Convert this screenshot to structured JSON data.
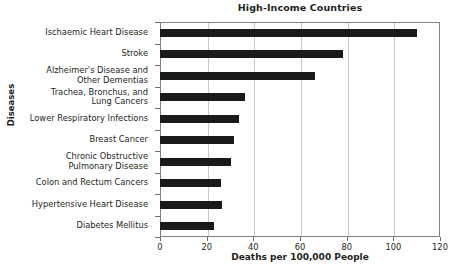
{
  "chart_data": {
    "type": "bar",
    "orientation": "horizontal",
    "title": "High-Income Countries",
    "xlabel": "Deaths per 100,000 People",
    "ylabel": "Diseases",
    "xlim": [
      0,
      120
    ],
    "xticks": [
      0,
      20,
      40,
      60,
      80,
      100,
      120
    ],
    "grid": "vertical",
    "legend": "none",
    "bar_color": "#1a1a1a",
    "categories": [
      "Ischaemic Heart Disease",
      "Stroke",
      "Alzheimer's Disease and\nOther Dementias",
      "Trachea, Bronchus, and\nLung Cancers",
      "Lower Respiratory Infections",
      "Breast Cancer",
      "Chronic Obstructive\nPulmonary Disease",
      "Colon and Rectum Cancers",
      "Hypertensive Heart Disease",
      "Diabetes Mellitus"
    ],
    "values": [
      110,
      78.5,
      66.5,
      36.5,
      34,
      31.5,
      30.5,
      26,
      26.5,
      23
    ]
  }
}
